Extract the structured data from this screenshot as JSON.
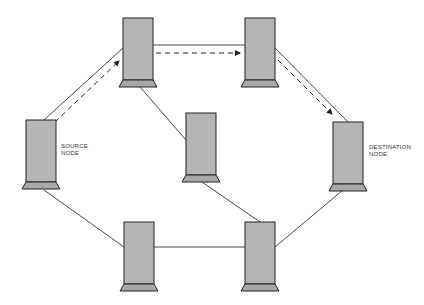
{
  "diagram": {
    "type": "network-routing",
    "nodes": [
      {
        "id": "source",
        "label_line1": "SOURCE",
        "label_line2": "NODE"
      },
      {
        "id": "top-left",
        "label_line1": "",
        "label_line2": ""
      },
      {
        "id": "top-right",
        "label_line1": "",
        "label_line2": ""
      },
      {
        "id": "destination",
        "label_line1": "DESTINATION",
        "label_line2": "NODE"
      },
      {
        "id": "middle",
        "label_line1": "",
        "label_line2": ""
      },
      {
        "id": "bottom-left",
        "label_line1": "",
        "label_line2": ""
      },
      {
        "id": "bottom-right",
        "label_line1": "",
        "label_line2": ""
      }
    ],
    "links": [
      [
        "source",
        "top-left"
      ],
      [
        "top-left",
        "top-right"
      ],
      [
        "top-right",
        "destination"
      ],
      [
        "top-left",
        "middle"
      ],
      [
        "middle",
        "bottom-right"
      ],
      [
        "source",
        "bottom-left"
      ],
      [
        "bottom-left",
        "bottom-right"
      ],
      [
        "bottom-right",
        "destination"
      ]
    ],
    "route_path": [
      "source",
      "top-left",
      "top-right",
      "destination"
    ],
    "colors": {
      "node_fill": "#b5b5b5",
      "node_stroke": "#222222",
      "link": "#333333"
    }
  }
}
